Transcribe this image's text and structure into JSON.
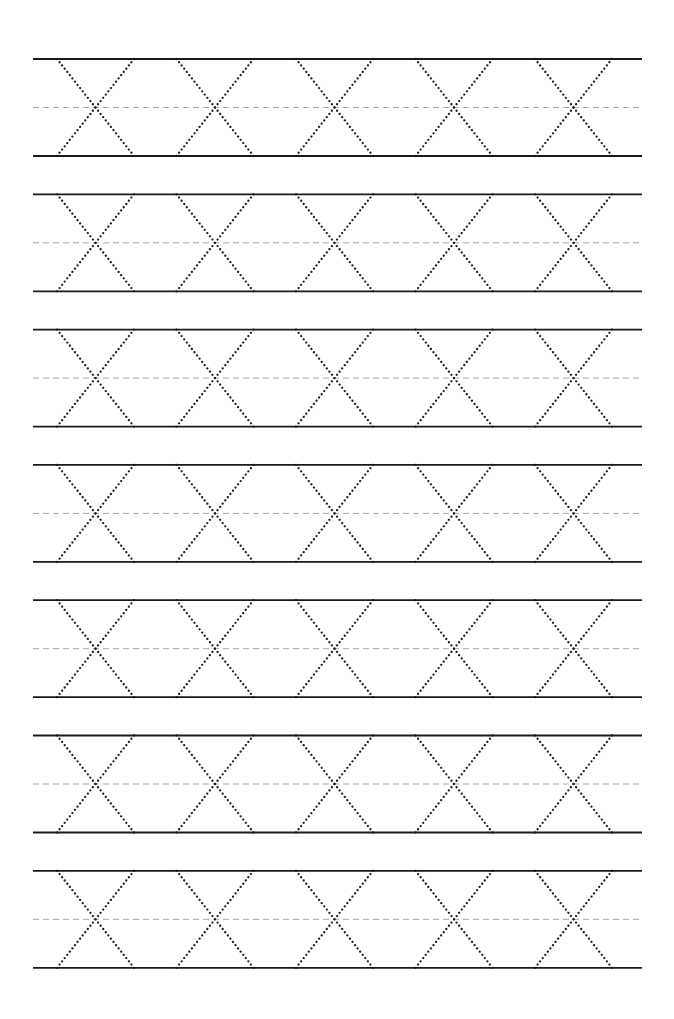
{
  "worksheet": {
    "title": "Letter X tracing practice",
    "letter": "X",
    "rows_count": 7,
    "letters_per_row": 5,
    "colors": {
      "background": "#ffffff",
      "solid_line": "#1a1a1a",
      "dashed_line": "#9a9a9a",
      "dots": "#1a1a1a"
    },
    "layout": {
      "line_left_x": 33,
      "line_right_x": 642,
      "first_row_top_y": 59,
      "row_height": 97,
      "row_pitch": 135.3,
      "first_letter_left_x": 57,
      "letter_width": 77,
      "letter_pitch": 119.5
    }
  }
}
